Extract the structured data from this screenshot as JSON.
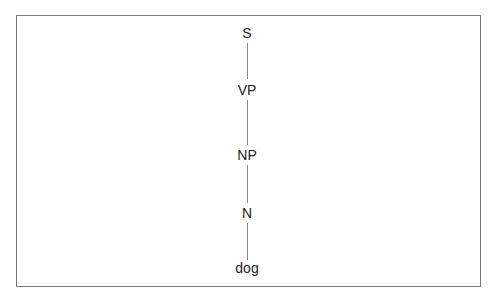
{
  "tree": {
    "nodes": [
      {
        "id": "S",
        "label": "S"
      },
      {
        "id": "VP",
        "label": "VP"
      },
      {
        "id": "NP",
        "label": "NP"
      },
      {
        "id": "N",
        "label": "N"
      },
      {
        "id": "dog",
        "label": "dog"
      }
    ],
    "edges": [
      [
        "S",
        "VP"
      ],
      [
        "VP",
        "NP"
      ],
      [
        "NP",
        "N"
      ],
      [
        "N",
        "dog"
      ]
    ]
  },
  "colors": {
    "text": "#222222",
    "edge": "#8a8a8a",
    "frame": "#7a7a7a",
    "background": "#ffffff"
  }
}
